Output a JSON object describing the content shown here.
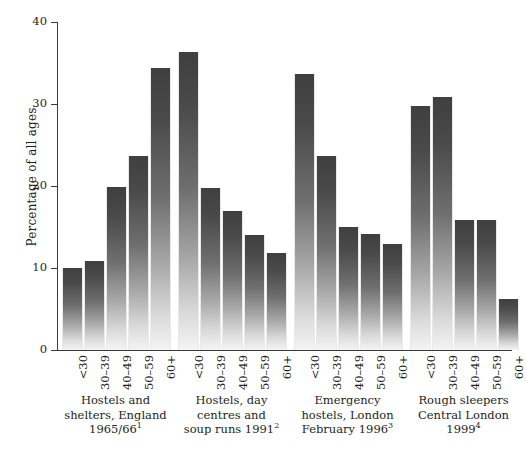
{
  "chart_data": {
    "type": "bar",
    "title": "",
    "xlabel": "",
    "ylabel": "Percentage of all ages",
    "ylim": [
      0,
      40
    ],
    "yticks": [
      0,
      10,
      20,
      30,
      40
    ],
    "grid": false,
    "legend": "none",
    "categories": [
      "<30",
      "30–39",
      "40–49",
      "50–59",
      "60+"
    ],
    "groups": [
      {
        "caption_lines": [
          "Hostels and",
          "shelters, England",
          "1965/66"
        ],
        "footnote_marker": "1",
        "values": [
          10.0,
          10.9,
          19.9,
          23.7,
          34.4
        ]
      },
      {
        "caption_lines": [
          "Hostels, day",
          "centres and",
          "soup runs 1991"
        ],
        "footnote_marker": "2",
        "values": [
          36.4,
          19.8,
          17.0,
          14.0,
          11.8
        ]
      },
      {
        "caption_lines": [
          "Emergency",
          "hostels, London",
          "February 1996"
        ],
        "footnote_marker": "3",
        "values": [
          33.6,
          23.7,
          15.0,
          14.2,
          12.9
        ]
      },
      {
        "caption_lines": [
          "Rough sleepers",
          "Central London",
          "1999"
        ],
        "footnote_marker": "4",
        "values": [
          29.8,
          30.8,
          15.8,
          15.8,
          6.2
        ]
      }
    ],
    "colors": {
      "bar_top": "#3f3f3f",
      "bar_bottom": "#f4f4f4",
      "axis": "#3a3a3a",
      "text": "#231f20",
      "background": "#ffffff"
    }
  }
}
